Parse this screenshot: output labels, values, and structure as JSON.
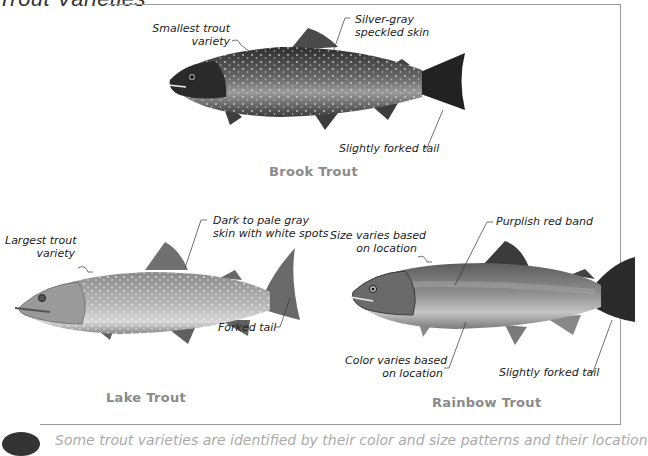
{
  "page": {
    "title": "Trout Varieties",
    "footer_text": "Some trout varieties are identified by their color and size patterns and their location"
  },
  "fish": [
    {
      "name": "Brook Trout",
      "labels": [
        {
          "line1": "Smallest trout",
          "line2": "variety"
        },
        {
          "line1": "Silver-gray",
          "line2": "speckled skin"
        },
        {
          "line1": "Slightly forked tail"
        }
      ]
    },
    {
      "name": "Lake Trout",
      "labels": [
        {
          "line1": "Largest trout",
          "line2": "variety"
        },
        {
          "line1": "Dark to pale gray",
          "line2": "skin with white spots"
        },
        {
          "line1": "Forked tail"
        }
      ]
    },
    {
      "name": "Rainbow Trout",
      "labels": [
        {
          "line1": "Size varies based",
          "line2": "on location"
        },
        {
          "line1": "Purplish red band"
        },
        {
          "line1": "Color varies based",
          "line2": "on location"
        },
        {
          "line1": "Slightly forked tail"
        }
      ]
    }
  ],
  "colors": {
    "frame": "#9a9a9a",
    "name_text": "#8a8a8a",
    "label_text": "#222222",
    "brook_body": "#6e6e6e",
    "lake_body": "#a8a8a8",
    "rainbow_body": "#8c8c8c"
  }
}
